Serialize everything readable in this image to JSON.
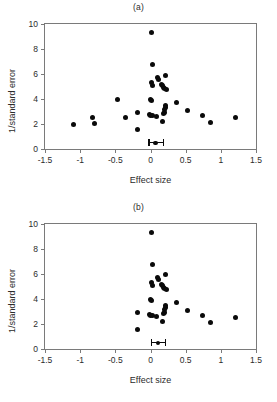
{
  "figure": {
    "background": "#ffffff",
    "marker_color": "#0a0a0a",
    "axis_color": "#7a7a7a"
  },
  "chart_data": [
    {
      "type": "scatter",
      "title": "(a)",
      "xlabel": "Effect size",
      "ylabel": "1/standard error",
      "xlim": [
        -1.5,
        1.5
      ],
      "ylim": [
        0,
        10
      ],
      "xticks": [
        -1.5,
        -1,
        -0.5,
        0,
        0.5,
        1,
        1.5
      ],
      "xtick_labels": [
        "-1.5",
        "-1",
        "-0.5",
        "0",
        "0.5",
        "1",
        "1.5"
      ],
      "yticks": [
        0,
        2,
        4,
        6,
        8,
        10
      ],
      "ytick_labels": [
        "0",
        "2",
        "4",
        "6",
        "8",
        "10"
      ],
      "grid": false,
      "legend": "none",
      "points": [
        {
          "x": 0.02,
          "y": 9.3
        },
        {
          "x": 0.03,
          "y": 6.8
        },
        {
          "x": 0.1,
          "y": 5.75
        },
        {
          "x": 0.12,
          "y": 5.6
        },
        {
          "x": 0.22,
          "y": 5.85
        },
        {
          "x": 0.02,
          "y": 5.3
        },
        {
          "x": 0.03,
          "y": 5.05
        },
        {
          "x": 0.15,
          "y": 5.2
        },
        {
          "x": 0.17,
          "y": 5.1
        },
        {
          "x": 0.18,
          "y": 4.95
        },
        {
          "x": 0.2,
          "y": 4.85
        },
        {
          "x": 0.23,
          "y": 4.8
        },
        {
          "x": 0.0,
          "y": 4.0
        },
        {
          "x": 0.02,
          "y": 3.9
        },
        {
          "x": -0.47,
          "y": 3.95
        },
        {
          "x": 0.21,
          "y": 3.45
        },
        {
          "x": 0.22,
          "y": 3.3
        },
        {
          "x": 0.2,
          "y": 3.15
        },
        {
          "x": 0.37,
          "y": 3.7
        },
        {
          "x": 0.52,
          "y": 3.1
        },
        {
          "x": -0.18,
          "y": 2.95
        },
        {
          "x": -0.02,
          "y": 2.75
        },
        {
          "x": 0.0,
          "y": 2.7
        },
        {
          "x": 0.03,
          "y": 2.68
        },
        {
          "x": 0.09,
          "y": 2.6
        },
        {
          "x": 0.18,
          "y": 2.85
        },
        {
          "x": 0.2,
          "y": 2.9
        },
        {
          "x": 0.17,
          "y": 2.2
        },
        {
          "x": -0.35,
          "y": 2.55
        },
        {
          "x": -0.82,
          "y": 2.55
        },
        {
          "x": -0.79,
          "y": 2.05
        },
        {
          "x": -1.1,
          "y": 2.0
        },
        {
          "x": -0.18,
          "y": 1.6
        },
        {
          "x": 0.74,
          "y": 2.65
        },
        {
          "x": 0.86,
          "y": 2.15
        },
        {
          "x": 1.21,
          "y": 2.55
        }
      ],
      "summary": {
        "x": 0.07,
        "y": 0.5,
        "ci_low": -0.03,
        "ci_high": 0.19
      }
    },
    {
      "type": "scatter",
      "title": "(b)",
      "xlabel": "Effect size",
      "ylabel": "1/standard error",
      "xlim": [
        -1.5,
        1.5
      ],
      "ylim": [
        0,
        10
      ],
      "xticks": [
        -1.5,
        -1,
        -0.5,
        0,
        0.5,
        1,
        1.5
      ],
      "xtick_labels": [
        "-1.5",
        "-1",
        "-0.5",
        "0",
        "0.5",
        "1",
        "1.5"
      ],
      "yticks": [
        0,
        2,
        4,
        6,
        8,
        10
      ],
      "ytick_labels": [
        "0",
        "2",
        "4",
        "6",
        "8",
        "10"
      ],
      "grid": false,
      "legend": "none",
      "points": [
        {
          "x": 0.02,
          "y": 9.3
        },
        {
          "x": 0.03,
          "y": 6.8
        },
        {
          "x": 0.1,
          "y": 5.75
        },
        {
          "x": 0.12,
          "y": 5.6
        },
        {
          "x": 0.22,
          "y": 5.95
        },
        {
          "x": 0.02,
          "y": 5.3
        },
        {
          "x": 0.03,
          "y": 5.05
        },
        {
          "x": 0.15,
          "y": 5.2
        },
        {
          "x": 0.17,
          "y": 5.1
        },
        {
          "x": 0.18,
          "y": 4.95
        },
        {
          "x": 0.2,
          "y": 4.85
        },
        {
          "x": 0.23,
          "y": 4.8
        },
        {
          "x": 0.0,
          "y": 4.0
        },
        {
          "x": 0.02,
          "y": 3.9
        },
        {
          "x": 0.21,
          "y": 3.45
        },
        {
          "x": 0.22,
          "y": 3.3
        },
        {
          "x": 0.2,
          "y": 3.15
        },
        {
          "x": 0.37,
          "y": 3.7
        },
        {
          "x": 0.52,
          "y": 3.1
        },
        {
          "x": -0.18,
          "y": 2.95
        },
        {
          "x": -0.02,
          "y": 2.75
        },
        {
          "x": 0.0,
          "y": 2.7
        },
        {
          "x": 0.03,
          "y": 2.68
        },
        {
          "x": 0.09,
          "y": 2.6
        },
        {
          "x": 0.18,
          "y": 2.85
        },
        {
          "x": 0.2,
          "y": 2.9
        },
        {
          "x": 0.17,
          "y": 2.2
        },
        {
          "x": -0.18,
          "y": 1.55
        },
        {
          "x": 0.74,
          "y": 2.65
        },
        {
          "x": 0.86,
          "y": 2.15
        },
        {
          "x": 1.21,
          "y": 2.55
        }
      ],
      "summary": {
        "x": 0.11,
        "y": 0.5,
        "ci_low": 0.0,
        "ci_high": 0.22
      }
    }
  ]
}
